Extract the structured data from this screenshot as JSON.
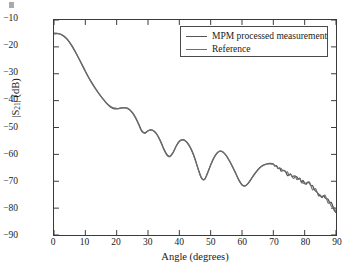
{
  "figure": {
    "background_color": "#ffffff",
    "axis_color": "#3a3a3a"
  },
  "chart_data": {
    "type": "line",
    "title": "",
    "xlabel": "Angle (degrees)",
    "ylabel": "|S21| (dB)",
    "ylabel_parts": {
      "prefix": "|S",
      "sub": "21",
      "suffix": "| (dB)"
    },
    "xlim": [
      0,
      90
    ],
    "ylim": [
      -90,
      -10
    ],
    "xticks": [
      0,
      10,
      20,
      30,
      40,
      50,
      60,
      70,
      80,
      90
    ],
    "xtick_labels": [
      "0",
      "10",
      "20",
      "30",
      "40",
      "50",
      "60",
      "70",
      "80",
      "90"
    ],
    "yticks": [
      -10,
      -20,
      -30,
      -40,
      -50,
      -60,
      -70,
      -80,
      -90
    ],
    "ytick_labels": [
      "−10",
      "−20",
      "−30",
      "−40",
      "−50",
      "−60",
      "−70",
      "−80",
      "−90"
    ],
    "grid": false,
    "legend_position": "top-right",
    "legend_entries": [
      "MPM processed measurement",
      "Reference"
    ],
    "series": [
      {
        "name": "MPM processed measurement",
        "color": "#555555",
        "width": 1.3,
        "x": [
          0,
          1,
          2,
          3,
          4,
          5,
          6,
          7,
          8,
          9,
          10,
          11,
          12,
          13,
          14,
          15,
          16,
          17,
          18,
          19,
          20,
          21,
          22,
          23,
          24,
          25,
          26,
          27,
          28,
          29,
          30,
          31,
          32,
          33,
          34,
          35,
          36,
          37,
          38,
          39,
          40,
          41,
          42,
          43,
          44,
          45,
          46,
          47,
          48,
          49,
          50,
          51,
          52,
          53,
          54,
          55,
          56,
          57,
          58,
          59,
          60,
          61,
          62,
          63,
          64,
          65,
          66,
          67,
          68,
          69,
          70,
          71,
          72,
          73,
          74,
          75,
          76,
          77,
          78,
          79,
          80,
          81,
          82,
          83,
          84,
          85,
          86,
          87,
          88,
          89,
          90
        ],
        "y": [
          -15.2,
          -15.1,
          -15.3,
          -15.9,
          -16.9,
          -18.3,
          -20.1,
          -22.2,
          -24.4,
          -26.7,
          -29.0,
          -31.2,
          -33.2,
          -35.1,
          -36.8,
          -38.4,
          -39.9,
          -41.3,
          -42.4,
          -43.0,
          -43.1,
          -42.9,
          -42.7,
          -42.7,
          -43.2,
          -44.4,
          -46.2,
          -48.6,
          -51.2,
          -52.0,
          -51.2,
          -50.9,
          -51.4,
          -52.8,
          -55.0,
          -57.8,
          -60.0,
          -60.7,
          -59.3,
          -56.9,
          -55.1,
          -54.5,
          -55.0,
          -56.4,
          -58.6,
          -61.6,
          -65.3,
          -68.5,
          -69.3,
          -67.0,
          -64.0,
          -61.4,
          -59.6,
          -58.8,
          -59.2,
          -60.5,
          -62.4,
          -64.6,
          -67.0,
          -69.5,
          -71.3,
          -71.7,
          -70.7,
          -69.0,
          -67.3,
          -65.8,
          -64.6,
          -63.9,
          -63.5,
          -63.4,
          -63.6,
          -64.2,
          -65.1,
          -66.0,
          -66.6,
          -67.6,
          -68.2,
          -68.1,
          -69.1,
          -70.4,
          -70.8,
          -70.3,
          -71.6,
          -72.9,
          -74.1,
          -75.2,
          -75.4,
          -76.5,
          -78.0,
          -79.4,
          -81.6
        ]
      },
      {
        "name": "Reference",
        "color": "#6e6e6e",
        "width": 1.1,
        "x": [
          0,
          1,
          2,
          3,
          4,
          5,
          6,
          7,
          8,
          9,
          10,
          11,
          12,
          13,
          14,
          15,
          16,
          17,
          18,
          19,
          20,
          21,
          22,
          23,
          24,
          25,
          26,
          27,
          28,
          29,
          30,
          31,
          32,
          33,
          34,
          35,
          36,
          37,
          38,
          39,
          40,
          41,
          42,
          43,
          44,
          45,
          46,
          47,
          48,
          49,
          50,
          51,
          52,
          53,
          54,
          55,
          56,
          57,
          58,
          59,
          60,
          61,
          62,
          63,
          64,
          65,
          66,
          67,
          68,
          69,
          70,
          71,
          72,
          73,
          74,
          75,
          76,
          77,
          78,
          79,
          80,
          81,
          82,
          83,
          84,
          85,
          86,
          87,
          88,
          89,
          90
        ],
        "y": [
          -14.9,
          -14.9,
          -15.2,
          -15.8,
          -16.9,
          -18.4,
          -20.3,
          -22.4,
          -24.6,
          -26.9,
          -29.2,
          -31.4,
          -33.4,
          -35.2,
          -36.9,
          -38.4,
          -39.8,
          -41.1,
          -42.1,
          -42.7,
          -42.9,
          -42.8,
          -42.6,
          -42.7,
          -43.3,
          -44.6,
          -46.5,
          -48.9,
          -51.5,
          -52.2,
          -51.3,
          -50.9,
          -51.5,
          -53.0,
          -55.3,
          -58.1,
          -60.3,
          -60.9,
          -59.4,
          -57.0,
          -55.2,
          -54.6,
          -55.1,
          -56.6,
          -58.8,
          -61.9,
          -65.6,
          -68.8,
          -69.4,
          -66.9,
          -63.9,
          -61.3,
          -59.5,
          -58.8,
          -59.2,
          -60.6,
          -62.5,
          -64.8,
          -67.2,
          -69.7,
          -71.4,
          -71.8,
          -70.8,
          -69.1,
          -67.4,
          -65.9,
          -64.7,
          -64.0,
          -63.6,
          -63.5,
          -63.7,
          -64.3,
          -65.2,
          -66.1,
          -66.7,
          -67.7,
          -68.3,
          -68.2,
          -69.2,
          -70.5,
          -70.9,
          -70.4,
          -71.7,
          -73.0,
          -74.2,
          -75.3,
          -75.5,
          -76.6,
          -78.1,
          -79.5,
          -81.7
        ]
      }
    ]
  }
}
